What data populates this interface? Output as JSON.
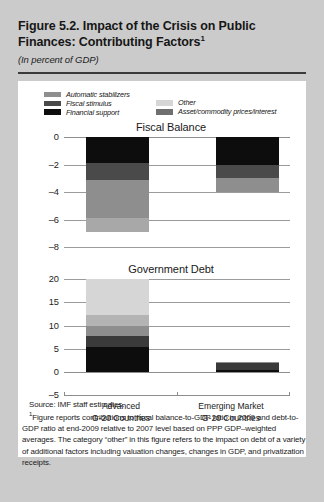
{
  "header": {
    "title": "Figure 5.2.  Impact of the Crisis on Public Finances: Contributing Factors",
    "title_footnote_marker": "1",
    "subtitle": "(In percent of GDP)"
  },
  "legend": {
    "items": [
      {
        "label": "Automatic stabilizers",
        "color": "#8e8e8e",
        "column": "left"
      },
      {
        "label": "Fiscal stimulus",
        "color": "#4a4a4a",
        "column": "left"
      },
      {
        "label": "Financial support",
        "color": "#0d0d0d",
        "column": "left"
      },
      {
        "label": "Other",
        "color": "#d6d6d6",
        "column": "right"
      },
      {
        "label": "Asset/commodity prices/interest",
        "color": "#6f6f6f",
        "column": "right"
      }
    ]
  },
  "footer": {
    "source": "Source: IMF staff estimates.",
    "note_marker": "1",
    "note": "Figure reports contributions to fiscal balance-to-GDP ratio in 2009 and debt-to-GDP ratio at end-2009 relative to 2007 level based on PPP GDP–weighted averages. The category “other” in this figure refers to the impact on debt of a variety of additional factors including valuation changes, changes in GDP, and privatization receipts."
  },
  "chart_data": [
    {
      "type": "bar",
      "subtype": "stacked",
      "title": "Fiscal Balance",
      "xlabel": "",
      "ylabel": "",
      "ylim": [
        -8,
        0
      ],
      "yticks": [
        0,
        -2,
        -4,
        -6,
        -8
      ],
      "ytick_labels": [
        "0",
        "–2",
        "–4",
        "–6",
        "–8"
      ],
      "grid": true,
      "categories": [
        "Advanced G-20 Countries",
        "Emerging Market G-20 Countries"
      ],
      "category_lines": [
        [
          "Advanced",
          "G-20 Countries"
        ],
        [
          "Emerging Market",
          "G-20 Countries"
        ]
      ],
      "series": [
        {
          "name": "Financial support",
          "color": "#0d0d0d",
          "values": [
            -1.9,
            -2.0
          ]
        },
        {
          "name": "Fiscal stimulus",
          "color": "#4a4a4a",
          "values": [
            -1.2,
            -1.0
          ]
        },
        {
          "name": "Automatic stabilizers",
          "color": "#8e8e8e",
          "values": [
            -2.8,
            -1.0
          ]
        },
        {
          "name": "Asset/commodity prices/interest",
          "color": "#a8a8a8",
          "values": [
            -1.0,
            0.0
          ]
        }
      ],
      "totals": [
        -6.9,
        -4.0
      ]
    },
    {
      "type": "bar",
      "subtype": "stacked",
      "title": "Government Debt",
      "xlabel": "",
      "ylabel": "",
      "ylim": [
        -5,
        20
      ],
      "yticks": [
        20,
        15,
        10,
        5,
        0,
        -5
      ],
      "ytick_labels": [
        "20",
        "15",
        "10",
        "5",
        "0",
        "–5"
      ],
      "grid": true,
      "categories": [
        "Advanced G-20 Countries",
        "Emerging Market G-20 Countries"
      ],
      "category_lines": [
        [
          "Advanced",
          "G-20 Countries"
        ],
        [
          "Emerging Market",
          "G-20 Countries"
        ]
      ],
      "series": [
        {
          "name": "Financial support",
          "color": "#0d0d0d",
          "values": [
            5.3,
            0.5
          ]
        },
        {
          "name": "Fiscal stimulus",
          "color": "#3a3a3a",
          "values": [
            2.5,
            1.5
          ]
        },
        {
          "name": "Automatic stabilizers",
          "color": "#8e8e8e",
          "values": [
            2.2,
            0.2
          ]
        },
        {
          "name": "Asset/commodity prices/interest",
          "color": "#b4b4b4",
          "values": [
            2.3,
            0.0
          ]
        },
        {
          "name": "Other",
          "color": "#d6d6d6",
          "values": [
            7.7,
            0.0
          ]
        }
      ],
      "totals": [
        20.0,
        2.2
      ]
    }
  ]
}
